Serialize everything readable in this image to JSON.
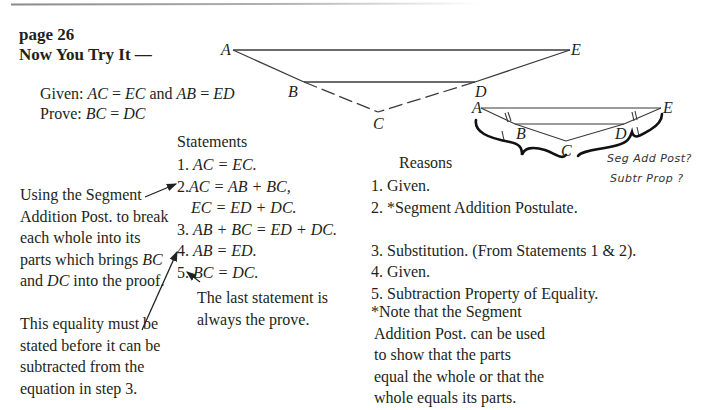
{
  "header": {
    "page_label": "page 26",
    "section_title": "Now You Try It —"
  },
  "problem": {
    "given_label": "Given:",
    "given_expr_1": "AC",
    "given_eq": " = ",
    "given_expr_2": "EC",
    "given_and": " and ",
    "given_expr_3": "AB",
    "given_expr_4": "ED",
    "prove_label": "Prove:",
    "prove_expr_1": "BC",
    "prove_expr_2": "DC"
  },
  "main_diagram": {
    "labels": {
      "A": "A",
      "E": "E",
      "B": "B",
      "D": "D",
      "C": "C"
    }
  },
  "small_diagram": {
    "labels": {
      "A": "A",
      "E": "E",
      "B": "B",
      "D": "D",
      "C": "C"
    },
    "handwritten": [
      "Seg Add Post?",
      "Subtr Prop ?"
    ]
  },
  "proof": {
    "statements_header": "Statements",
    "reasons_header": "Reasons",
    "statements": [
      {
        "num": "1. ",
        "text": "AC = EC."
      },
      {
        "num": "2.",
        "text": "AC = AB + BC,"
      },
      {
        "num": "",
        "text": "EC = ED + DC."
      },
      {
        "num": "3. ",
        "text": "AB + BC = ED + DC."
      },
      {
        "num": "4. ",
        "text": "AB = ED."
      },
      {
        "num": "5. ",
        "text": "BC = DC."
      }
    ],
    "reasons": [
      "1. Given.",
      "2. *Segment Addition Postulate.",
      "",
      "3. Substitution. (From Statements 1 & 2).",
      "4. Given.",
      "5. Subtraction Property of Equality."
    ]
  },
  "annotations": {
    "segment_addition_note": "Using the Segment Addition Post. to break each whole into its parts which brings",
    "segment_addition_note_bc": "BC",
    "segment_addition_note_and": " and ",
    "segment_addition_note_dc": "DC",
    "segment_addition_note_end": " into the proof.",
    "equality_note": "This equality must be stated before it can be subtracted from the equation in step 3.",
    "last_statement_note": "The last statement is always the prove.",
    "footnote_lines": [
      "*Note that the Segment",
      "Addition Post. can be used",
      "to show that the parts",
      "equal the whole or that the",
      "whole equals its parts."
    ]
  }
}
